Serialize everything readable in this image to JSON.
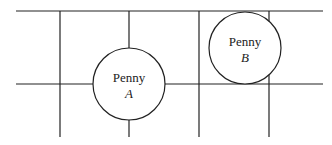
{
  "diagram": {
    "colors": {
      "line": "#222222",
      "background": "#ffffff"
    },
    "grid": {
      "horizontal_lines": [
        {
          "y": 11,
          "x1": 16,
          "x2": 323
        },
        {
          "y": 84,
          "x1": 16,
          "x2": 323
        }
      ],
      "vertical_lines": [
        {
          "x": 60,
          "y1": 11,
          "y2": 137
        },
        {
          "x": 129,
          "y1": 11,
          "y2": 137
        },
        {
          "x": 199,
          "y1": 11,
          "y2": 137
        },
        {
          "x": 269,
          "y1": 11,
          "y2": 137
        }
      ]
    },
    "pennies": [
      {
        "name": "Penny",
        "letter": "A",
        "cx": 129,
        "cy": 84,
        "r": 36
      },
      {
        "name": "Penny",
        "letter": "B",
        "cx": 245,
        "cy": 48,
        "r": 36
      }
    ]
  }
}
